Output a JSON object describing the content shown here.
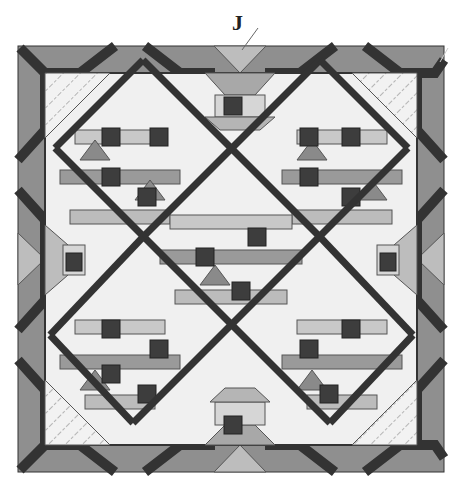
{
  "diagram": {
    "label": "J",
    "colors": {
      "background": "#ffffff",
      "dark": "#3a3a3a",
      "mid": "#8c8c8c",
      "light_mid": "#b0b0b0",
      "light": "#eeeeee",
      "pale": "#f6f6f6",
      "outline": "#555555"
    }
  }
}
